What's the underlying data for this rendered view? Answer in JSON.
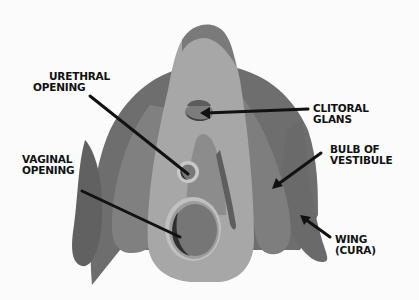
{
  "diagram": {
    "type": "anatomical-illustration",
    "colors": {
      "background": "#fbfbfb",
      "outer_hood_dark": "#6e6e6e",
      "outer_hood_rim": "#7a7a7a",
      "inner_light": "#a9a9a9",
      "bulb_mid": "#858585",
      "wing_dark": "#666666",
      "ring_light": "#c4c4c4",
      "opening_fill": "#777777",
      "opening_shadow": "#3a3a3a",
      "glans_fill": "#7a7a7a",
      "glans_top": "#5c5c5c",
      "arrow": "#111111"
    }
  },
  "labels": {
    "urethral_opening": {
      "line1": "URETHRAL",
      "line2": "OPENING"
    },
    "clitoral_glans": {
      "line1": "CLITORAL",
      "line2": "GLANS"
    },
    "vaginal_opening": {
      "line1": "VAGINAL",
      "line2": "OPENING"
    },
    "bulb_of_vestibule": {
      "line1": "BULB OF",
      "line2": "VESTIBULE"
    },
    "wing_crura": {
      "line1": "WING",
      "line2": "(CURA)"
    }
  }
}
